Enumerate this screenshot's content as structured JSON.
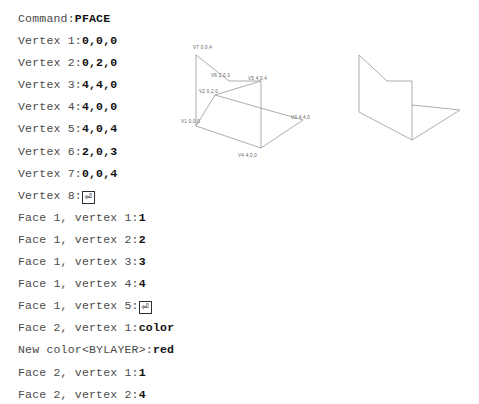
{
  "transcript": {
    "lines": [
      {
        "prompt": "Command:",
        "value": "PFACE"
      },
      {
        "prompt": "Vertex 1:",
        "value": "0,0,0"
      },
      {
        "prompt": "Vertex 2:",
        "value": "0,2,0"
      },
      {
        "prompt": "Vertex 3:",
        "value": "4,4,0"
      },
      {
        "prompt": "Vertex 4:",
        "value": "4,0,0"
      },
      {
        "prompt": "Vertex 5:",
        "value": "4,0,4"
      },
      {
        "prompt": "Vertex 6:",
        "value": "2,0,3"
      },
      {
        "prompt": "Vertex 7:",
        "value": "0,0,4"
      },
      {
        "prompt": "Vertex 8:",
        "value": "",
        "key": "enter"
      },
      {
        "prompt": "Face 1, vertex 1:",
        "value": "1"
      },
      {
        "prompt": "Face 1, vertex 2:",
        "value": "2"
      },
      {
        "prompt": "Face 1, vertex 3:",
        "value": "3"
      },
      {
        "prompt": "Face 1, vertex 4:",
        "value": "4"
      },
      {
        "prompt": "Face 1, vertex 5:",
        "value": "",
        "key": "enter"
      },
      {
        "prompt": "Face 2, vertex 1:",
        "value": "color"
      },
      {
        "prompt": "New color<BYLAYER>:",
        "value": "red"
      },
      {
        "prompt": "Face 2, vertex 1:",
        "value": "1"
      },
      {
        "prompt": "Face 2, vertex 2:",
        "value": "4"
      }
    ],
    "enter_key_glyph": "⏎"
  },
  "figures": {
    "wireframe": {
      "name": "pface-vertex-wireframe",
      "stroke_color": "#8a8a8a",
      "label_color": "#5c5c5c",
      "vertex_labels": [
        {
          "id": "V1",
          "coords": "0,0,0",
          "text": "V1  0,0,0",
          "x": 8,
          "y": 92
        },
        {
          "id": "V2",
          "coords": "0,2,0",
          "text": "V2  0,2,0",
          "x": 24,
          "y": 68
        },
        {
          "id": "V3",
          "coords": "4,4,0",
          "text": "V3  4,4,0",
          "x": 114,
          "y": 88
        },
        {
          "id": "V4",
          "coords": "4,0,0",
          "text": "V4  4,0,0",
          "x": 62,
          "y": 124
        },
        {
          "id": "V5",
          "coords": "4,0,4",
          "text": "V5  4,0,4",
          "x": 72,
          "y": 52
        },
        {
          "id": "V6",
          "coords": "2,0,3",
          "text": "V6  2,0,3",
          "x": 36,
          "y": 46
        },
        {
          "id": "V7",
          "coords": "0,0,4",
          "text": "V7  0,0,4",
          "x": 18,
          "y": 19
        }
      ]
    },
    "solid": {
      "name": "pface-result-solid",
      "stroke_color": "#8a8a8a"
    }
  }
}
